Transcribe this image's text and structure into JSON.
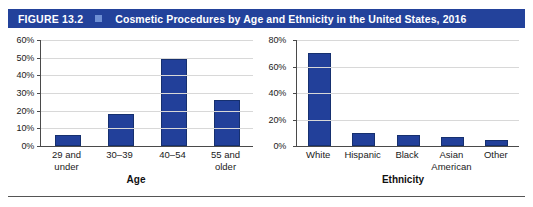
{
  "figure": {
    "number_label": "FIGURE 13.2",
    "marker_icon": "square-marker-icon",
    "title": "Cosmetic Procedures by Age and Ethnicity in the United States, 2016",
    "header_bg": "#23429B",
    "marker_color": "#6E8FD4",
    "bar_color": "#22409A"
  },
  "chart_data": [
    {
      "type": "bar",
      "id": "age",
      "title": "",
      "xlabel": "Age",
      "ylabel": "",
      "categories": [
        "29 and\nunder",
        "30–39",
        "40–54",
        "55 and\nolder"
      ],
      "values": [
        6,
        18,
        49,
        26
      ],
      "ylim": [
        0,
        60
      ],
      "yticks": [
        0,
        10,
        20,
        30,
        40,
        50,
        60
      ],
      "ytick_labels": [
        "0%",
        "10%",
        "20%",
        "30%",
        "40%",
        "50%",
        "60%"
      ],
      "grid": true,
      "legend": "none",
      "bar_color": "#22409A"
    },
    {
      "type": "bar",
      "id": "ethnicity",
      "title": "",
      "xlabel": "Ethnicity",
      "ylabel": "",
      "categories": [
        "White",
        "Hispanic",
        "Black",
        "Asian\nAmerican",
        "Other"
      ],
      "values": [
        70,
        10,
        8,
        6.5,
        4.5
      ],
      "ylim": [
        0,
        80
      ],
      "yticks": [
        0,
        20,
        40,
        60,
        80
      ],
      "ytick_labels": [
        "0%",
        "20%",
        "40%",
        "60%",
        "80%"
      ],
      "grid": true,
      "legend": "none",
      "bar_color": "#22409A"
    }
  ]
}
